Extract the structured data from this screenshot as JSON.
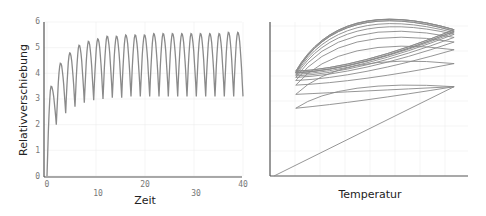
{
  "chart_data": [
    {
      "type": "line",
      "title": "",
      "xlabel": "Zeit",
      "ylabel": "Relativverschiebung",
      "xlim": [
        0,
        40
      ],
      "ylim": [
        0,
        6
      ],
      "xticks": [
        0,
        10,
        20,
        30,
        40
      ],
      "yticks": [
        0,
        1,
        2,
        3,
        4,
        5,
        6
      ],
      "grid": true,
      "legend": null,
      "series": [
        {
          "name": "Relativverschiebung",
          "color": "#8a8a8a",
          "description": "Oscillating displacement rising from 0, ~21 cycles over 0-40, peaks growing then saturating near 5.6, troughs saturating near 3.1",
          "cycles": 21,
          "peaks": [
            3.5,
            4.4,
            4.8,
            5.1,
            5.25,
            5.35,
            5.45,
            5.45,
            5.5,
            5.5,
            5.5,
            5.55,
            5.55,
            5.55,
            5.55,
            5.55,
            5.55,
            5.55,
            5.55,
            5.6,
            5.6
          ],
          "troughs": [
            2.0,
            2.45,
            2.7,
            2.85,
            2.95,
            3.0,
            3.05,
            3.05,
            3.1,
            3.1,
            3.1,
            3.1,
            3.1,
            3.1,
            3.1,
            3.1,
            3.1,
            3.1,
            3.1,
            3.1,
            3.1
          ]
        }
      ]
    },
    {
      "type": "line",
      "title": "",
      "xlabel": "Temperatur",
      "ylabel": "",
      "xticks": [],
      "yticks": [],
      "grid": true,
      "legend": null,
      "series": [
        {
          "name": "Hysterese",
          "color": "#8a8a8a",
          "description": "Hysteresis loops in Relativverschiebung vs Temperatur: initial straight ramp from origin, subsequent loops converging to a stable lens-shaped loop between low and high temperature",
          "loop_lower_x": 0.13,
          "loop_upper_x": 0.93,
          "loop_low_bottoms": [
            0.44,
            0.53,
            0.59,
            0.62,
            0.64,
            0.65,
            0.66,
            0.67,
            0.67,
            0.67,
            0.68,
            0.68
          ],
          "loop_high_tops": [
            0.58,
            0.73,
            0.82,
            0.87,
            0.9,
            0.92,
            0.93,
            0.94,
            0.94,
            0.95,
            0.95,
            0.95
          ]
        }
      ]
    }
  ],
  "labels": {
    "left_ylabel": "Relativverschiebung",
    "left_xlabel": "Zeit",
    "right_xlabel": "Temperatur",
    "left_yticks": [
      "0",
      "1",
      "2",
      "3",
      "4",
      "5",
      "6"
    ],
    "left_xticks_top": [
      "0",
      "20",
      "40"
    ],
    "left_xticks_bottom": [
      "10",
      "30"
    ]
  }
}
